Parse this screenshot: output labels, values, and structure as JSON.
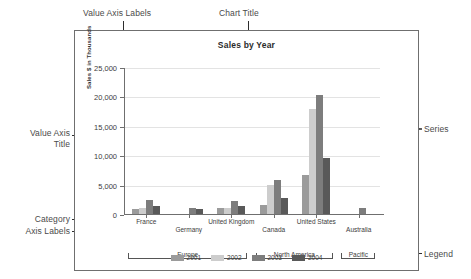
{
  "annotations": {
    "value_axis_labels": "Value Axis Labels",
    "chart_title": "Chart Title",
    "value_axis_title": "Value Axis",
    "value_axis_title2": "Title",
    "category_axis_labels": "Category",
    "category_axis_labels2": "Axis Labels",
    "series": "Series",
    "legend": "Legend"
  },
  "chart_data": {
    "type": "bar",
    "title": "Sales by Year",
    "xlabel": "",
    "ylabel": "Sales $ in Thousands",
    "ylim": [
      0,
      25000
    ],
    "ytick_labels": [
      "25,000",
      "20,000",
      "15,000",
      "10,000",
      "5,000",
      "0"
    ],
    "ytick_values": [
      25000,
      20000,
      15000,
      10000,
      5000,
      0
    ],
    "grid": true,
    "legend_position": "bottom",
    "categories": [
      "France",
      "Germany",
      "United Kingdom",
      "Canada",
      "United States",
      "Australia"
    ],
    "groups": [
      {
        "label": "Europe",
        "span": [
          0,
          2
        ]
      },
      {
        "label": "North America",
        "span": [
          3,
          4
        ]
      },
      {
        "label": "Pacific",
        "span": [
          5,
          5
        ]
      }
    ],
    "series": [
      {
        "name": "2001",
        "color": "#9b9b9b",
        "values": [
          900,
          0,
          950,
          1600,
          6700,
          0
        ]
      },
      {
        "name": "2002",
        "color": "#cdcdcd",
        "values": [
          1000,
          0,
          1000,
          5000,
          17800,
          0
        ]
      },
      {
        "name": "2003",
        "color": "#7d7d7d",
        "values": [
          2350,
          1050,
          2250,
          5800,
          20300,
          1000
        ]
      },
      {
        "name": "2004",
        "color": "#595959",
        "values": [
          1400,
          900,
          1400,
          2700,
          9600,
          0
        ]
      }
    ]
  }
}
